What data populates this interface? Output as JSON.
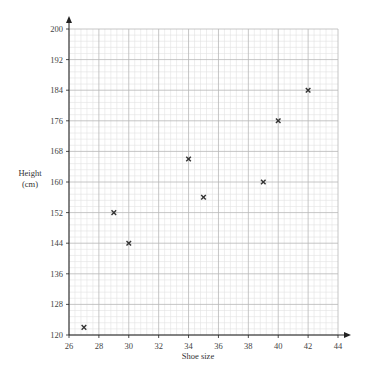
{
  "chart_data": {
    "type": "scatter",
    "title": "",
    "xlabel": "Shoe size",
    "ylabel": "Height",
    "ylabel_unit": "(cm)",
    "xlim": [
      26,
      44
    ],
    "ylim": [
      120,
      200
    ],
    "x_ticks": [
      26,
      28,
      30,
      32,
      34,
      36,
      38,
      40,
      42,
      44
    ],
    "y_ticks": [
      120,
      128,
      136,
      144,
      152,
      160,
      168,
      176,
      184,
      192,
      200
    ],
    "grid": true,
    "grid_minor_subdivisions": 5,
    "marker": "x",
    "legend": null,
    "series": [
      {
        "name": "Shoe size vs Height",
        "points": [
          {
            "x": 27,
            "y": 122
          },
          {
            "x": 29,
            "y": 152
          },
          {
            "x": 30,
            "y": 144
          },
          {
            "x": 34,
            "y": 166
          },
          {
            "x": 35,
            "y": 156
          },
          {
            "x": 39,
            "y": 160
          },
          {
            "x": 40,
            "y": 176
          },
          {
            "x": 42,
            "y": 184
          }
        ]
      }
    ]
  },
  "colors": {
    "axis": "#222222",
    "grid_major": "#b8b8b8",
    "grid_minor": "#e2e2e2",
    "marker": "#333333"
  }
}
